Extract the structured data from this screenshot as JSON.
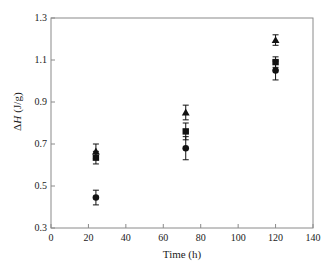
{
  "chart_data": {
    "type": "scatter",
    "title": "",
    "xlabel": "Time (h)",
    "ylabel": "ΔH (J/g)",
    "ylabel_parts": {
      "delta": "Δ",
      "italic": "H",
      "units": " (J/g)"
    },
    "xlim": [
      0,
      140
    ],
    "ylim": [
      0.3,
      1.3
    ],
    "xticks": [
      0,
      20,
      40,
      60,
      80,
      100,
      120,
      140
    ],
    "yticks": [
      0.3,
      0.5,
      0.7,
      0.9,
      1.1,
      1.3
    ],
    "xtick_labels": [
      "0",
      "20",
      "40",
      "60",
      "80",
      "100",
      "120",
      "140"
    ],
    "ytick_labels": [
      "0.3",
      "0.5",
      "0.7",
      "0.9",
      "1.1",
      "1.3"
    ],
    "grid": false,
    "legend": "none",
    "marker_color": "#121212",
    "axis_color": "#8a8a8a",
    "x": [
      24,
      72,
      120
    ],
    "series": [
      {
        "name": "triangle-series",
        "marker": "triangle",
        "values": [
          0.665,
          0.85,
          1.195
        ],
        "errors": [
          0.035,
          0.035,
          0.025
        ]
      },
      {
        "name": "square-series",
        "marker": "square",
        "values": [
          0.635,
          0.76,
          1.09
        ],
        "errors": [
          0.03,
          0.04,
          0.025
        ]
      },
      {
        "name": "circle-series",
        "marker": "circle",
        "values": [
          0.445,
          0.68,
          1.05
        ],
        "errors": [
          0.035,
          0.055,
          0.045
        ]
      }
    ]
  }
}
